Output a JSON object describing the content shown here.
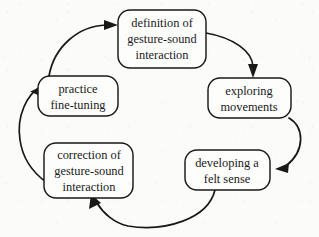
{
  "diagram": {
    "type": "cycle",
    "title": "",
    "node_count": 5,
    "direction": "clockwise",
    "colors": {
      "stroke": "#191919",
      "node_fill": "#fdfdfc",
      "background": "#fbfbfa",
      "text": "#1a1a1a"
    },
    "nodes": [
      {
        "id": "definition",
        "position": "top",
        "lines": [
          "definition of",
          "gesture-sound",
          "interaction"
        ]
      },
      {
        "id": "exploring",
        "position": "right",
        "lines": [
          "exploring",
          "movements"
        ]
      },
      {
        "id": "felt-sense",
        "position": "bottom-right",
        "lines": [
          "developing a",
          "felt sense"
        ]
      },
      {
        "id": "correction",
        "position": "bottom-left",
        "lines": [
          "correction of",
          "gesture-sound",
          "interaction"
        ]
      },
      {
        "id": "practice",
        "position": "left",
        "lines": [
          "practice",
          "fine-tuning"
        ]
      }
    ],
    "edges": [
      {
        "id": "edge-practice-to-definition",
        "from": "practice",
        "to": "definition",
        "style": "curved-arrow"
      },
      {
        "id": "edge-definition-to-exploring",
        "from": "definition",
        "to": "exploring",
        "style": "curved-arrow"
      },
      {
        "id": "edge-exploring-to-felt-sense",
        "from": "exploring",
        "to": "felt-sense",
        "style": "curved-arrow"
      },
      {
        "id": "edge-felt-sense-to-correction",
        "from": "felt-sense",
        "to": "correction",
        "style": "curved-arrow"
      },
      {
        "id": "edge-correction-to-practice",
        "from": "correction",
        "to": "practice",
        "style": "curved-arrow"
      }
    ]
  }
}
